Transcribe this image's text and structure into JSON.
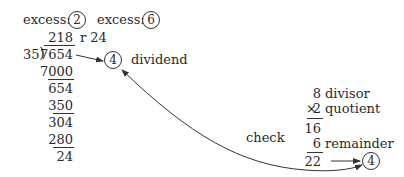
{
  "excess": {
    "label": "excess:",
    "left_value": "2",
    "right_value": "6"
  },
  "long_division": {
    "quotient": "218",
    "remainder_label": "r 24",
    "divisor": "35",
    "dividend": "7654",
    "steps": [
      "7000",
      "654",
      "350",
      "304",
      "280",
      "24"
    ]
  },
  "dividend_check": {
    "value": "4",
    "label": "dividend"
  },
  "check_label": "check",
  "verification": {
    "divisor_value": "8",
    "divisor_label": "divisor",
    "times_sign": "×",
    "quotient_value": "2",
    "quotient_label": "quotient",
    "product": "16",
    "remainder_value": "6",
    "remainder_label": "remainder",
    "sum": "22",
    "result": "4"
  }
}
